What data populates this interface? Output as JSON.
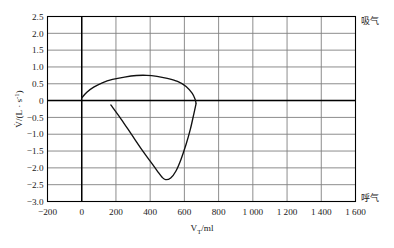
{
  "chart_data": {
    "type": "line",
    "title": "",
    "xlabel": "V_T/ml",
    "ylabel": "V̇/(L · s⁻¹)",
    "xlim": [
      -200,
      1600
    ],
    "ylim": [
      -3.0,
      2.5
    ],
    "grid": true,
    "xticks": [
      "-200",
      "0",
      "200",
      "400",
      "600",
      "800",
      "1 000",
      "1 200",
      "1 400",
      "1 600"
    ],
    "xtick_values": [
      -200,
      0,
      200,
      400,
      600,
      800,
      1000,
      1200,
      1400,
      1600
    ],
    "yticks": [
      "2.5",
      "2.0",
      "1.5",
      "1.0",
      "0.5",
      "0",
      "-0.5",
      "-1.0",
      "-1.5",
      "-2.0",
      "-2.5",
      "-3.0"
    ],
    "ytick_values": [
      2.5,
      2.0,
      1.5,
      1.0,
      0.5,
      0,
      -0.5,
      -1.0,
      -1.5,
      -2.0,
      -2.5,
      -3.0
    ],
    "series": [
      {
        "name": "inspiratory-limb",
        "points": [
          [
            0,
            0.08
          ],
          [
            30,
            0.25
          ],
          [
            70,
            0.4
          ],
          [
            120,
            0.53
          ],
          [
            180,
            0.63
          ],
          [
            250,
            0.7
          ],
          [
            320,
            0.745
          ],
          [
            380,
            0.75
          ],
          [
            440,
            0.72
          ],
          [
            500,
            0.66
          ],
          [
            560,
            0.57
          ],
          [
            610,
            0.42
          ],
          [
            645,
            0.22
          ],
          [
            662,
            0.05
          ],
          [
            668,
            -0.08
          ]
        ]
      },
      {
        "name": "expiratory-limb",
        "points": [
          [
            170,
            -0.13
          ],
          [
            230,
            -0.55
          ],
          [
            290,
            -1.0
          ],
          [
            350,
            -1.45
          ],
          [
            400,
            -1.8
          ],
          [
            440,
            -2.08
          ],
          [
            470,
            -2.28
          ],
          [
            490,
            -2.35
          ],
          [
            520,
            -2.3
          ],
          [
            550,
            -2.1
          ],
          [
            580,
            -1.75
          ],
          [
            610,
            -1.3
          ],
          [
            635,
            -0.85
          ],
          [
            655,
            -0.4
          ],
          [
            668,
            -0.1
          ]
        ]
      }
    ],
    "annotations": [
      {
        "name": "inhale-label",
        "text": "吸气",
        "position": "top-right"
      },
      {
        "name": "exhale-label",
        "text": "呼气",
        "position": "bottom-right"
      }
    ],
    "ylabel_parts": {
      "dotv": "V̇",
      "slash": "/(L · s",
      "exp": "-1",
      "close": ")"
    },
    "xlabel_parts": {
      "v": "V",
      "sub": "T",
      "unit": "/ml"
    }
  },
  "colors": {
    "curve": "#111111",
    "grid": "#808080",
    "axis": "#000000",
    "background": "#ffffff"
  }
}
